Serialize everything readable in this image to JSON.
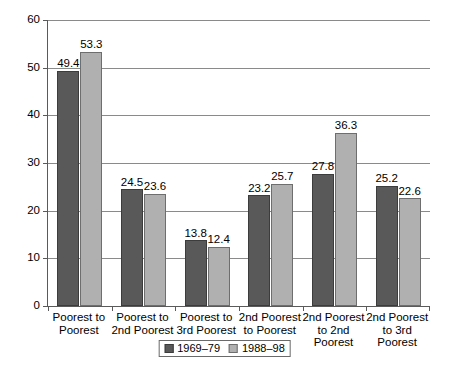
{
  "chart_data": {
    "type": "bar",
    "title": "",
    "subtitle": "",
    "xlabel": "",
    "ylabel": "",
    "ylim": [
      0,
      60
    ],
    "yticks": [
      0,
      10,
      20,
      30,
      40,
      50,
      60
    ],
    "ytick_labels": [
      "0",
      "10",
      "20",
      "30",
      "40",
      "50",
      "60"
    ],
    "grid": true,
    "legend_position": "bottom-center",
    "categories": [
      "Poorest to Poorest",
      "Poorest to 2nd Poorest",
      "Poorest to 3rd Poorest",
      "2nd Poorest to Poorest",
      "2nd Poorest to 2nd Poorest",
      "2nd Poorest to 3rd Poorest"
    ],
    "category_lines": [
      [
        "Poorest to",
        "Poorest"
      ],
      [
        "Poorest to",
        "2nd Poorest"
      ],
      [
        "Poorest to",
        "3rd Poorest"
      ],
      [
        "2nd Poorest",
        "to Poorest"
      ],
      [
        "2nd Poorest",
        "to 2nd Poorest"
      ],
      [
        "2nd Poorest",
        "to 3rd Poorest"
      ]
    ],
    "series": [
      {
        "name": "1969–79",
        "color": "#595959",
        "values": [
          49.4,
          24.5,
          13.8,
          23.2,
          27.8,
          25.2
        ],
        "value_labels": [
          "49.4",
          "24.5",
          "13.8",
          "23.2",
          "27.8",
          "25.2"
        ]
      },
      {
        "name": "1988–98",
        "color": "#b0b0b0",
        "values": [
          53.3,
          23.6,
          12.4,
          25.7,
          36.3,
          22.6
        ],
        "value_labels": [
          "53.3",
          "23.6",
          "12.4",
          "25.7",
          "36.3",
          "22.6"
        ]
      }
    ]
  },
  "colors": {
    "series_1969_79": "#595959",
    "series_1988_98": "#b0b0b0",
    "axis": "#5a5a5a",
    "grid": "#8a8a8a",
    "background": "#ffffff"
  }
}
